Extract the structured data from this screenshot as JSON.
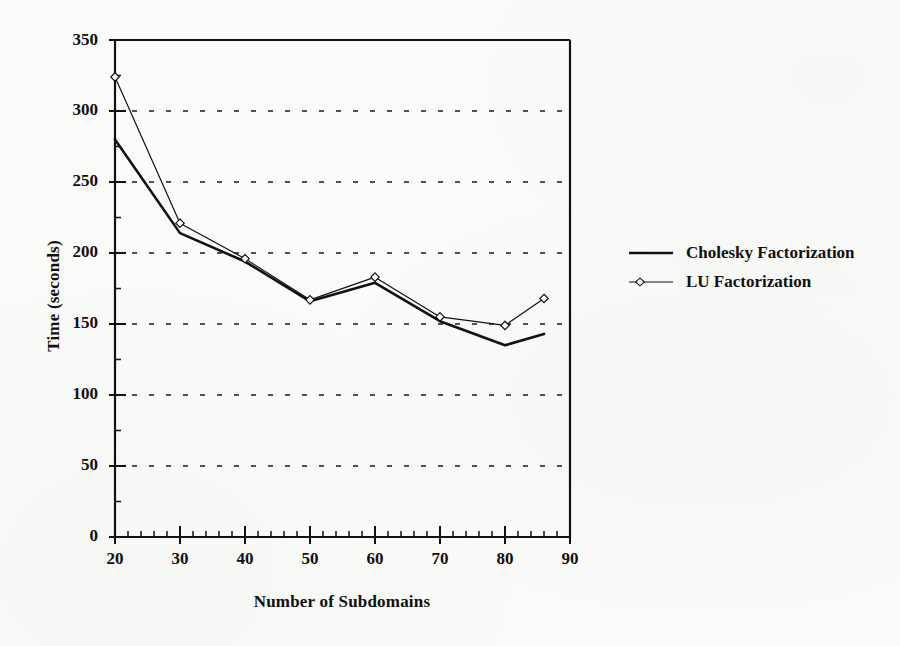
{
  "figure": {
    "background_color": "#fbfbf9",
    "ink_color": "#111111"
  },
  "chart_data": {
    "type": "line",
    "title": "",
    "xlabel": "Number of Subdomains",
    "ylabel": "Time (seconds)",
    "xlim": [
      20,
      90
    ],
    "ylim": [
      0,
      350
    ],
    "xticks": [
      20,
      30,
      40,
      50,
      60,
      70,
      80,
      90
    ],
    "yticks": [
      0,
      50,
      100,
      150,
      200,
      250,
      300,
      350
    ],
    "x_minor_tick_step": 2,
    "y_minor_tick_step": 25,
    "grid": {
      "horizontal": true,
      "vertical": false,
      "style": "dotted",
      "at": [
        50,
        100,
        150,
        200,
        250,
        300
      ]
    },
    "legend_position": "right",
    "series": [
      {
        "name": "Cholesky Factorization",
        "marker": "none",
        "line_style": "solid",
        "line_width": 2.6,
        "color": "#111111",
        "x": [
          20,
          30,
          40,
          50,
          60,
          70,
          80,
          86
        ],
        "values": [
          280,
          214,
          194,
          166,
          179,
          152,
          135,
          143
        ]
      },
      {
        "name": "LU Factorization",
        "marker": "diamond",
        "line_style": "solid",
        "line_width": 1.2,
        "color": "#111111",
        "x": [
          20,
          30,
          40,
          50,
          60,
          70,
          80,
          86
        ],
        "values": [
          324,
          221,
          196,
          167,
          183,
          155,
          149,
          168
        ]
      }
    ]
  },
  "axis_labels": {
    "x_title": "Number of Subdomains",
    "y_title": "Time (seconds)",
    "y_ticks": [
      "350",
      "300",
      "250",
      "200",
      "150",
      "100",
      "50",
      "0"
    ],
    "x_ticks": [
      "20",
      "30",
      "40",
      "50",
      "60",
      "70",
      "80",
      "90"
    ]
  },
  "legend": {
    "items": [
      {
        "label": "Cholesky Factorization",
        "icon": "solid-line-swatch"
      },
      {
        "label": "LU Factorization",
        "icon": "diamond-line-swatch"
      }
    ]
  }
}
